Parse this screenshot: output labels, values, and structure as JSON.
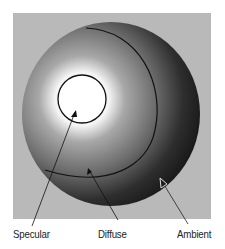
{
  "diagram": {
    "background_color": "#b9b9b9",
    "regions": [
      {
        "name": "specular",
        "description": "bright highlight circle"
      },
      {
        "name": "diffuse",
        "description": "mid-tone gradient region"
      },
      {
        "name": "ambient",
        "description": "dark shadow region"
      }
    ],
    "labels": {
      "specular": "Specular",
      "diffuse": "Diffuse",
      "ambient": "Ambient"
    }
  }
}
